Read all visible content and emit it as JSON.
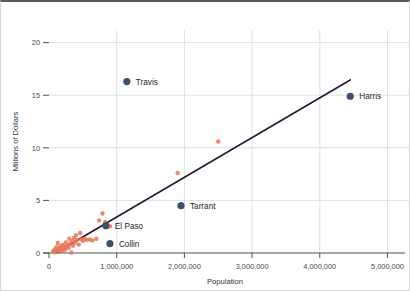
{
  "chart_data": {
    "type": "scatter",
    "title": "",
    "xlabel": "Population",
    "ylabel": "Millions of Dollars",
    "xlim": [
      0,
      5200000
    ],
    "ylim": [
      0,
      21.2
    ],
    "grid": true,
    "legend_position": "none",
    "xticks": [
      0,
      1000000,
      2000000,
      3000000,
      4000000,
      5000000
    ],
    "xticklabels": [
      "0",
      "1,000,000",
      "2,000,000",
      "3,000,000",
      "4,000,000",
      "5,000,000"
    ],
    "yticks": [
      0,
      5,
      10,
      15,
      20
    ],
    "yticklabels": [
      "0",
      "5",
      "10",
      "15",
      "20"
    ],
    "colors": {
      "point": "#E8785A",
      "highlight_point": "#3D4F6E",
      "trendline": "#2B1533",
      "gridline": "#D6D8DA",
      "axis": "#4A4E53",
      "background": "#FFFFFF"
    },
    "series": [
      {
        "name": "Counties",
        "color": "#E8785A",
        "points": [
          [
            60000,
            0.15
          ],
          [
            75000,
            0.2
          ],
          [
            90000,
            0.35
          ],
          [
            95000,
            0.1
          ],
          [
            110000,
            0.55
          ],
          [
            120000,
            0.3
          ],
          [
            130000,
            0.95
          ],
          [
            140000,
            0.25
          ],
          [
            150000,
            0.5
          ],
          [
            160000,
            0.15
          ],
          [
            175000,
            0.65
          ],
          [
            185000,
            0.4
          ],
          [
            195000,
            0.2
          ],
          [
            205000,
            0.8
          ],
          [
            215000,
            0.45
          ],
          [
            225000,
            0.6
          ],
          [
            235000,
            0.3
          ],
          [
            250000,
            1.0
          ],
          [
            260000,
            0.55
          ],
          [
            275000,
            0.75
          ],
          [
            290000,
            0.5
          ],
          [
            300000,
            1.35
          ],
          [
            315000,
            0.9
          ],
          [
            330000,
            0.05
          ],
          [
            345000,
            1.15
          ],
          [
            355000,
            0.7
          ],
          [
            370000,
            1.45
          ],
          [
            385000,
            1.0
          ],
          [
            400000,
            1.7
          ],
          [
            420000,
            1.25
          ],
          [
            440000,
            0.8
          ],
          [
            460000,
            1.9
          ],
          [
            480000,
            1.3
          ],
          [
            500000,
            1.15
          ],
          [
            530000,
            1.35
          ],
          [
            560000,
            1.25
          ],
          [
            600000,
            1.3
          ],
          [
            640000,
            1.2
          ],
          [
            700000,
            1.35
          ],
          [
            740000,
            3.1
          ],
          [
            790000,
            3.75
          ],
          [
            830000,
            2.95
          ],
          [
            900000,
            2.55
          ],
          [
            1900000,
            7.6
          ],
          [
            2500000,
            10.6
          ]
        ]
      },
      {
        "name": "Highlighted Counties",
        "color": "#3D4F6E",
        "points": [
          {
            "label": "Travis",
            "x": 1150000,
            "y": 16.3,
            "label_dx": 9,
            "label_dy": 3
          },
          {
            "label": "Harris",
            "x": 4450000,
            "y": 14.9,
            "label_dx": 9,
            "label_dy": 3
          },
          {
            "label": "Tarrant",
            "x": 1950000,
            "y": 4.5,
            "label_dx": 9,
            "label_dy": 3
          },
          {
            "label": "El Paso",
            "x": 840000,
            "y": 2.6,
            "label_dx": 9,
            "label_dy": 3
          },
          {
            "label": "Collin",
            "x": 900000,
            "y": 0.9,
            "label_dx": 9,
            "label_dy": 3
          }
        ]
      }
    ],
    "trendline": {
      "name": "Linear trend",
      "color": "#2B1533",
      "x0": 95000,
      "y0": 0.0,
      "x1": 4450000,
      "y1": 16.45
    }
  }
}
